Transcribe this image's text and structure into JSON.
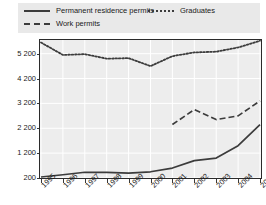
{
  "legend": {
    "entries": [
      {
        "label": "Permanent residence permits",
        "style": "solid",
        "icon": "solid-line-icon"
      },
      {
        "label": "Graduates",
        "style": "dotted",
        "icon": "dotted-line-icon"
      },
      {
        "label": "Work permits",
        "style": "dashed",
        "icon": "dashed-line-icon"
      }
    ]
  },
  "axes": {
    "y_ticks": [
      "200",
      "1 200",
      "2 200",
      "3 200",
      "4 200",
      "5 200"
    ],
    "x_ticks": [
      "1995",
      "1996",
      "1997",
      "1998",
      "1999",
      "2000",
      "2001",
      "2002",
      "2003",
      "2004",
      "2005"
    ]
  },
  "colors": {
    "line": "#3c3c3c",
    "plot_background": "#ededed",
    "legend_background": "#e9e9e9",
    "gridline": "#ffffff",
    "frame": "#2b2b2b",
    "text": "#1a1a1a"
  },
  "chart_data": {
    "type": "line",
    "title": "",
    "xlabel": "",
    "ylabel": "",
    "grid": true,
    "legend_position": "top",
    "x": [
      1995,
      1996,
      1997,
      1998,
      1999,
      2000,
      2001,
      2002,
      2003,
      2004,
      2005
    ],
    "ylim": [
      200,
      5750
    ],
    "xlim": [
      1995,
      2005
    ],
    "yticks": [
      200,
      1200,
      2200,
      3200,
      4200,
      5200
    ],
    "series": [
      {
        "name": "Permanent residence permits",
        "style": "solid",
        "values": [
          240,
          330,
          430,
          430,
          400,
          450,
          600,
          900,
          1000,
          1500,
          2350
        ]
      },
      {
        "name": "Graduates",
        "style": "dotted",
        "values": [
          5650,
          5150,
          5180,
          5000,
          5020,
          4700,
          5100,
          5250,
          5280,
          5450,
          5720
        ]
      },
      {
        "name": "Work permits",
        "style": "dashed",
        "values": [
          null,
          null,
          null,
          null,
          null,
          null,
          2350,
          2950,
          2550,
          2700,
          3300
        ]
      }
    ]
  }
}
